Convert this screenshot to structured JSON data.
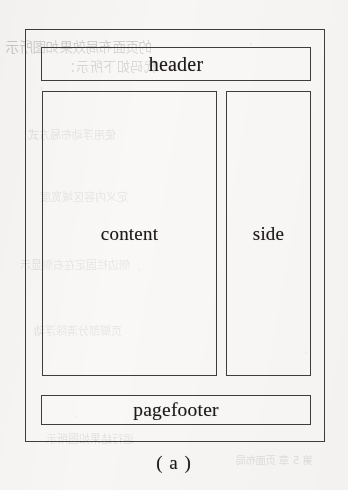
{
  "figure": {
    "caption": "( a )",
    "frame_label": "page-frame",
    "boxes": [
      {
        "id": "header",
        "label": "header"
      },
      {
        "id": "content",
        "label": "content"
      },
      {
        "id": "side",
        "label": "side"
      },
      {
        "id": "pagefooter",
        "label": "pagefooter"
      }
    ]
  },
  "scan_bleedthrough": {
    "note": "faint mirrored show-through text from the reverse side of the scanned page",
    "lines": [
      "的页面布局效果如图所示",
      "代码如下所示：",
      "使用浮动布局方式",
      "定义内容区域宽度",
      "侧边栏固定在右侧显示",
      "页脚部分清除浮动",
      "运行结果如图所示",
      "第 5 章 页面布局"
    ]
  },
  "colors": {
    "paper": "#f7f6f4",
    "ink": "#1d1a19",
    "stroke": "#403c3b",
    "bleed": "rgba(92,86,84,0.30)"
  }
}
